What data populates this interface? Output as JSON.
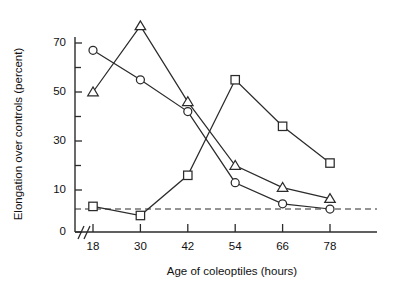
{
  "chart_data": {
    "type": "line",
    "title": "",
    "xlabel": "Age of coleoptiles (hours)",
    "ylabel": "Elongation over controls (percent)",
    "x": [
      18,
      30,
      42,
      54,
      66,
      78
    ],
    "x_tick_labels": [
      "18",
      "30",
      "42",
      "54",
      "66",
      "78"
    ],
    "y_tick_labels": [
      "0",
      "10",
      "30",
      "50",
      "70"
    ],
    "y_tick_values": [
      0,
      10,
      30,
      50,
      70
    ],
    "y_minor_ticks": [
      20,
      40,
      60,
      80
    ],
    "ylim": [
      0,
      80
    ],
    "xlim": [
      12,
      84
    ],
    "axis_break": true,
    "grid": false,
    "legend": "none",
    "reference_line": {
      "value": 5,
      "style": "dashed",
      "label": ""
    },
    "series": [
      {
        "name": "circle-series",
        "marker": "circle",
        "values": [
          67,
          55,
          42,
          13,
          7,
          5
        ]
      },
      {
        "name": "triangle-series",
        "marker": "triangle",
        "values": [
          50,
          77,
          46,
          20,
          11,
          9
        ]
      },
      {
        "name": "square-series",
        "marker": "square",
        "values": [
          6,
          2.5,
          16,
          55,
          36,
          21
        ]
      }
    ]
  }
}
